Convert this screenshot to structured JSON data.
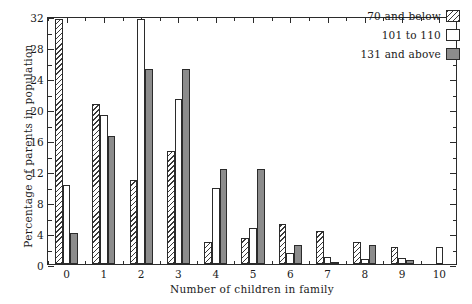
{
  "chart_data": {
    "type": "bar",
    "title": "",
    "xlabel": "Number of children in family",
    "ylabel": "Percentage of parents in population",
    "categories": [
      "0",
      "1",
      "2",
      "3",
      "4",
      "5",
      "6",
      "7",
      "8",
      "9",
      "10"
    ],
    "series": [
      {
        "name": "70 and below",
        "pattern": "hatched",
        "values": [
          31.6,
          20.7,
          10.9,
          14.6,
          2.8,
          3.3,
          5.2,
          4.3,
          2.9,
          2.2,
          0.0
        ]
      },
      {
        "name": "101 to 110",
        "pattern": "white",
        "values": [
          10.2,
          19.2,
          31.6,
          21.3,
          9.8,
          4.6,
          1.4,
          0.9,
          0.7,
          0.8,
          2.2
        ]
      },
      {
        "name": "131 and above",
        "pattern": "gray",
        "values": [
          4.0,
          16.5,
          25.1,
          25.1,
          12.3,
          12.3,
          2.5,
          0.3,
          2.4,
          0.5,
          0.0
        ]
      }
    ],
    "ylim": [
      0,
      32
    ],
    "ytick_major": [
      0,
      4,
      8,
      12,
      16,
      20,
      24,
      28,
      32
    ],
    "ytick_minor": [
      2,
      6,
      10,
      14,
      18,
      22,
      26,
      30
    ],
    "ytick_labels": [
      "0",
      "4",
      "8",
      "12",
      "16",
      "20",
      "24",
      "28",
      "32"
    ],
    "grid": false,
    "legend_position": "top-right",
    "legend_entries": [
      "70 and below",
      "101 to 110",
      "131 and above"
    ],
    "colors": {
      "axis": "#2b2b2b",
      "series_hatched": "#ffffff",
      "series_white": "#ffffff",
      "series_gray": "#8c8c8c",
      "background": "#ffffff"
    }
  }
}
